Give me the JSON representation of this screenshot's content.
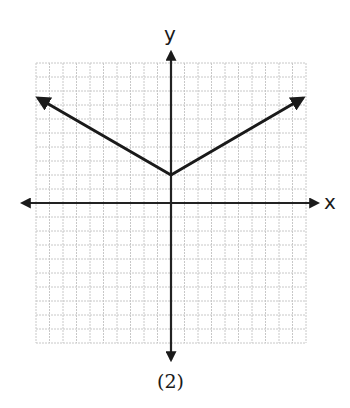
{
  "figure": {
    "caption": "(2)",
    "x_axis_label": "x",
    "y_axis_label": "y"
  },
  "chart_data": {
    "type": "line",
    "title": "",
    "caption": "(2)",
    "xlabel": "x",
    "ylabel": "y",
    "grid": true,
    "grid_cells": [
      20,
      20
    ],
    "xlim": [
      -10,
      10
    ],
    "ylim": [
      -10,
      10
    ],
    "series": [
      {
        "name": "absolute value graph",
        "description": "V-shaped graph with vertex at (0, 2), arrows on both ends",
        "x": [
          -10,
          0,
          10
        ],
        "y": [
          7.5,
          2,
          7.5
        ]
      }
    ],
    "vertex": [
      0,
      2
    ],
    "colors": {
      "grid": "#c8c8c8",
      "axes": "#222222",
      "curve": "#1a1a1a"
    }
  }
}
